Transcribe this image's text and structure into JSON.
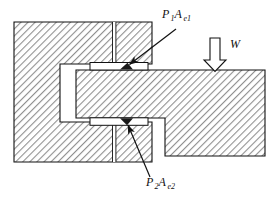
{
  "figure": {
    "type": "engineering-cross-section",
    "background_color": "#ffffff",
    "line_color": "#111111",
    "hatch_color": "#9a9a9a",
    "hatch_angle_deg": 45,
    "gasket_color": "#1a1a1a",
    "void_color": "#ffffff"
  },
  "labels": {
    "upper_seal": {
      "name": "P1Ae1",
      "base": "P",
      "base_sub": "1",
      "area": "A",
      "area_sub": "e1",
      "meaning": "pressure force on upper effective seal area",
      "x": 162,
      "y": 18
    },
    "lower_seal": {
      "name": "P2Ae2",
      "base": "P",
      "base_sub": "2",
      "area": "A",
      "area_sub": "e2",
      "meaning": "pressure force on lower effective seal area",
      "x": 146,
      "y": 186
    },
    "load": {
      "name": "W",
      "text": "W",
      "meaning": "external downward load",
      "x": 228,
      "y": 44
    }
  },
  "arrows": {
    "upper_leader": {
      "from_x": 175,
      "from_y": 28,
      "to_x": 126,
      "to_y": 63,
      "style": "solid-line-filled-head"
    },
    "lower_leader": {
      "from_x": 150,
      "from_y": 178,
      "to_x": 126,
      "to_y": 126,
      "style": "solid-line-filled-head"
    },
    "load_arrow": {
      "x": 215,
      "top_y": 38,
      "tip_y": 71,
      "style": "hollow-outlined-block-arrow",
      "direction": "down"
    }
  },
  "geometry": {
    "left_body": {
      "name": "left-housing-block",
      "outline": "M14,22 L152,22 L152,64 L60,64 L60,122 L152,122 L152,162 L14,162 Z",
      "hatched": true
    },
    "right_body": {
      "name": "right-stepped-block",
      "outline": "M76,70 L265,70 L265,156 L165,156 L165,118 L76,118 Z",
      "hatched": true
    },
    "vertical_gap": {
      "name": "bore-centerline-gap",
      "x": 113,
      "top_y": 22,
      "bottom_y": 162,
      "width": 3
    },
    "upper_seal_cavity": {
      "name": "upper-seal-cavity",
      "x": 90,
      "y": 63,
      "width": 58,
      "height": 7
    },
    "lower_seal_cavity": {
      "name": "lower-seal-cavity",
      "x": 90,
      "y": 118,
      "width": 58,
      "height": 7
    }
  }
}
